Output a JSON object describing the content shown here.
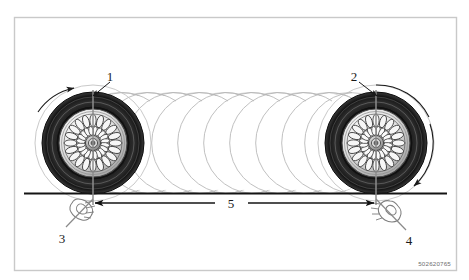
{
  "figure": {
    "kind": "technical-illustration",
    "part_number": "502620765",
    "background_color": "#ffffff",
    "frame_color": "#c9c9c9",
    "ink_color": "#1a1a1a",
    "ghost_color": "#b9b9b9"
  },
  "callouts": [
    {
      "id": "1",
      "label": "1",
      "target": "left-wheel-start-mark"
    },
    {
      "id": "2",
      "label": "2",
      "target": "right-wheel-end-mark"
    },
    {
      "id": "3",
      "label": "3",
      "target": "left-hand-chalk-mark"
    },
    {
      "id": "4",
      "label": "4",
      "target": "right-hand-chalk-mark"
    },
    {
      "id": "5",
      "label": "5",
      "target": "rolling-distance-dimension"
    }
  ],
  "elements": {
    "left_wheel_name": "left-wheel",
    "right_wheel_name": "right-wheel",
    "ground_line_name": "ground-line",
    "motion_trail_name": "rolling-motion-trail",
    "dimension_name": "distance-dimension-arrow",
    "rotation_arrow_left": "rotation-arrow-left",
    "rotation_arrow_right": "rotation-arrow-right"
  },
  "geometry": {
    "frame": {
      "x": 14,
      "y": 17,
      "w": 443,
      "h": 254
    },
    "ground_y": 193,
    "left_wheel": {
      "cx": 93,
      "cy": 143,
      "r_tire": 52,
      "r_ghost": 58
    },
    "right_wheel": {
      "cx": 376,
      "cy": 143,
      "r_tire": 52,
      "r_ghost": 58
    },
    "trail_count": 11,
    "dimension": {
      "x1": 93,
      "x2": 376,
      "y": 202
    }
  }
}
